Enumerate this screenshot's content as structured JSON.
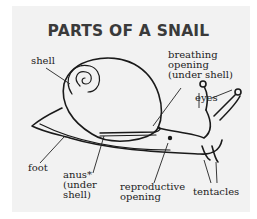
{
  "title": "PARTS OF A SNAIL",
  "labels": {
    "shell": "shell",
    "breathing_opening": [
      "breathing",
      "opening",
      "(under shell)"
    ],
    "eyes": "eyes",
    "foot": "foot",
    "anus": [
      "anus*",
      "(under",
      "shell)"
    ],
    "reproductive_opening": [
      "reproductive",
      "opening"
    ],
    "tentacles": "tentacles"
  },
  "colors": {
    "panel": "#f2f2f2",
    "line": "#1a1a1a",
    "title": "#3a3a3a"
  }
}
